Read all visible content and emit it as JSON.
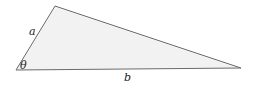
{
  "diagram": {
    "type": "triangle",
    "fill": "#f2f2f2",
    "stroke": "#6b6b6b",
    "vertices": {
      "bottom_left": [
        16,
        70
      ],
      "top": [
        55,
        6
      ],
      "right": [
        241,
        68
      ]
    },
    "labels": {
      "side_a": "a",
      "side_b": "b",
      "angle": "θ"
    }
  }
}
